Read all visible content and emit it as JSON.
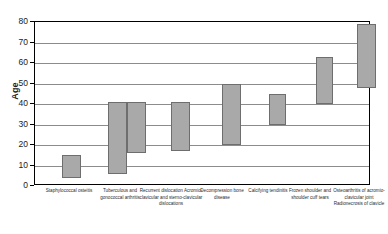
{
  "chart_data": {
    "type": "bar",
    "subtype": "floating-range-bar",
    "title": "",
    "xlabel": "",
    "ylabel": "Age",
    "ylim": [
      0,
      80
    ],
    "ytick_step": 10,
    "yticks": [
      0,
      10,
      20,
      30,
      40,
      50,
      60,
      70,
      80
    ],
    "grid": true,
    "legend": false,
    "categories": [
      "Staphylococcal osteitis",
      "Tuberculous and gonococcal arthritis",
      "Recurrent dislocation Acromio-clavicular and sterno-clavicular dislocations",
      "Decompression bone disease",
      "Calcifying tendinitis",
      "Frozen shoulder and shoulder cuff tears",
      "Osteoarthritis of acromio-clavicular joint Radionecrosis of clavicle"
    ],
    "bars": [
      {
        "category": "Staphylococcal osteitis",
        "low": 4,
        "high": 15
      },
      {
        "category": "Tuberculous and gonococcal arthritis",
        "low": 6,
        "high": 41
      },
      {
        "category": "Tuberculous and gonococcal arthritis",
        "low": 16,
        "high": 41
      },
      {
        "category": "Recurrent dislocation Acromio-clavicular and sterno-clavicular dislocations",
        "low": 17,
        "high": 41
      },
      {
        "category": "Decompression bone disease",
        "low": 20,
        "high": 50
      },
      {
        "category": "Calcifying tendinitis",
        "low": 30,
        "high": 45
      },
      {
        "category": "Frozen shoulder and shoulder cuff tears",
        "low": 40,
        "high": 63
      },
      {
        "category": "Osteoarthritis of acromio-clavicular joint Radionecrosis of clavicle",
        "low": 48,
        "high": 79
      }
    ],
    "colors": {
      "bar_fill": "#a9a9a9",
      "bar_border": "#6e6e6e",
      "gridline": "#8c8c8c",
      "axis": "#000000",
      "background": "#ffffff",
      "text": "#1a1a1a"
    }
  },
  "axis": {
    "y_title": "Age"
  },
  "labels": {
    "items": [
      {
        "text": "Staphylococcal osteitis",
        "left": 6,
        "width": 58
      },
      {
        "text": "Tuberculous and gonococcal arthritis",
        "left": 58,
        "width": 56
      },
      {
        "text": "Recurrent dislocation Acromio-clavicular and sterno-clavicular dislocations",
        "left": 104,
        "width": 66
      },
      {
        "text": "Decompression bone disease",
        "left": 160,
        "width": 56
      },
      {
        "text": "Calcifying tendinitis",
        "left": 209,
        "width": 50
      },
      {
        "text": "Frozen shoulder and shoulder cuff tears",
        "left": 248,
        "width": 56
      },
      {
        "text": "Osteoarthritis of acromio-clavicular joint Radionecrosis of clavicle",
        "left": 296,
        "width": 58
      }
    ]
  }
}
